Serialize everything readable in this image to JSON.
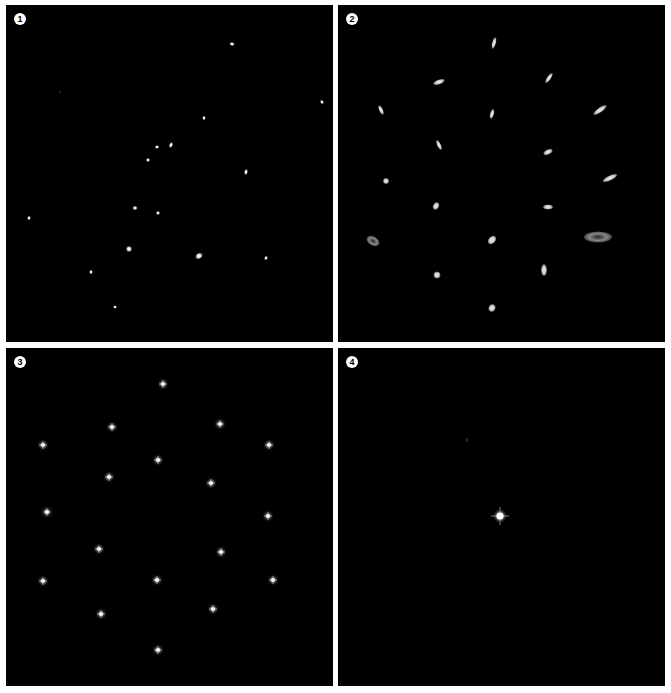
{
  "figure": {
    "background": "#ffffff",
    "panels": [
      {
        "label": "1",
        "box": {
          "x": 6,
          "y": 5,
          "w": 327,
          "h": 337
        },
        "spot_style": "elongated",
        "spots": [
          {
            "x": 232,
            "y": 44,
            "w": 6,
            "h": 3,
            "rot": 20
          },
          {
            "x": 60,
            "y": 92,
            "w": 2,
            "h": 2,
            "rot": 0,
            "dim": true
          },
          {
            "x": 322,
            "y": 102,
            "w": 5,
            "h": 3,
            "rot": 60
          },
          {
            "x": 204,
            "y": 118,
            "w": 3,
            "h": 5,
            "rot": 0
          },
          {
            "x": 157,
            "y": 147,
            "w": 5,
            "h": 3,
            "rot": -15
          },
          {
            "x": 171,
            "y": 145,
            "w": 3,
            "h": 7,
            "rot": 20
          },
          {
            "x": 148,
            "y": 160,
            "w": 4,
            "h": 4,
            "rot": 0
          },
          {
            "x": 246,
            "y": 172,
            "w": 3,
            "h": 7,
            "rot": 10
          },
          {
            "x": 135,
            "y": 208,
            "w": 5,
            "h": 4,
            "rot": 0
          },
          {
            "x": 158,
            "y": 213,
            "w": 4,
            "h": 4,
            "rot": 0
          },
          {
            "x": 29,
            "y": 218,
            "w": 3,
            "h": 5,
            "rot": 20
          },
          {
            "x": 129,
            "y": 249,
            "w": 6,
            "h": 6,
            "rot": 0
          },
          {
            "x": 199,
            "y": 256,
            "w": 9,
            "h": 5,
            "rot": -30
          },
          {
            "x": 266,
            "y": 258,
            "w": 3,
            "h": 5,
            "rot": 20
          },
          {
            "x": 91,
            "y": 272,
            "w": 3,
            "h": 5,
            "rot": 0
          },
          {
            "x": 115,
            "y": 307,
            "w": 4,
            "h": 3,
            "rot": 0
          }
        ]
      },
      {
        "label": "2",
        "box": {
          "x": 338,
          "y": 5,
          "w": 327,
          "h": 337
        },
        "spot_style": "blurred",
        "spots": [
          {
            "x": 494,
            "y": 43,
            "w": 4,
            "h": 12,
            "rot": 15
          },
          {
            "x": 439,
            "y": 82,
            "w": 12,
            "h": 5,
            "rot": -20
          },
          {
            "x": 549,
            "y": 78,
            "w": 4,
            "h": 12,
            "rot": 35
          },
          {
            "x": 381,
            "y": 110,
            "w": 4,
            "h": 10,
            "rot": -25
          },
          {
            "x": 492,
            "y": 114,
            "w": 4,
            "h": 10,
            "rot": 15
          },
          {
            "x": 600,
            "y": 110,
            "w": 16,
            "h": 5,
            "rot": -35
          },
          {
            "x": 439,
            "y": 145,
            "w": 4,
            "h": 11,
            "rot": -25
          },
          {
            "x": 548,
            "y": 152,
            "w": 10,
            "h": 5,
            "rot": -25
          },
          {
            "x": 386,
            "y": 181,
            "w": 6,
            "h": 6,
            "rot": 0
          },
          {
            "x": 610,
            "y": 178,
            "w": 16,
            "h": 5,
            "rot": -25
          },
          {
            "x": 436,
            "y": 206,
            "w": 6,
            "h": 8,
            "rot": 30
          },
          {
            "x": 548,
            "y": 207,
            "w": 10,
            "h": 5,
            "rot": 0
          },
          {
            "x": 373,
            "y": 241,
            "w": 14,
            "h": 9,
            "rot": 30,
            "ring": true
          },
          {
            "x": 492,
            "y": 240,
            "w": 10,
            "h": 7,
            "rot": -45
          },
          {
            "x": 598,
            "y": 237,
            "w": 28,
            "h": 11,
            "rot": 0,
            "ring": true
          },
          {
            "x": 437,
            "y": 275,
            "w": 7,
            "h": 7,
            "rot": 0
          },
          {
            "x": 544,
            "y": 270,
            "w": 6,
            "h": 12,
            "rot": 0
          },
          {
            "x": 492,
            "y": 308,
            "w": 7,
            "h": 8,
            "rot": 30
          }
        ]
      },
      {
        "label": "3",
        "box": {
          "x": 6,
          "y": 348,
          "w": 327,
          "h": 338
        },
        "spot_style": "star",
        "spots": [
          {
            "x": 163,
            "y": 384
          },
          {
            "x": 112,
            "y": 427
          },
          {
            "x": 220,
            "y": 424
          },
          {
            "x": 43,
            "y": 445
          },
          {
            "x": 269,
            "y": 445
          },
          {
            "x": 158,
            "y": 460
          },
          {
            "x": 109,
            "y": 477
          },
          {
            "x": 211,
            "y": 483
          },
          {
            "x": 47,
            "y": 512
          },
          {
            "x": 268,
            "y": 516
          },
          {
            "x": 99,
            "y": 549
          },
          {
            "x": 221,
            "y": 552
          },
          {
            "x": 43,
            "y": 581
          },
          {
            "x": 157,
            "y": 580
          },
          {
            "x": 273,
            "y": 580
          },
          {
            "x": 101,
            "y": 614
          },
          {
            "x": 213,
            "y": 609
          },
          {
            "x": 158,
            "y": 650
          }
        ]
      },
      {
        "label": "4",
        "box": {
          "x": 338,
          "y": 348,
          "w": 327,
          "h": 338
        },
        "spot_style": "star",
        "spots": [
          {
            "x": 500,
            "y": 516,
            "size": 18
          },
          {
            "x": 467,
            "y": 440,
            "size": 4,
            "dim": true
          }
        ]
      }
    ]
  }
}
